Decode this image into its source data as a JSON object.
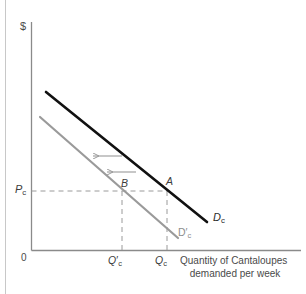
{
  "figure": {
    "axis": {
      "y_label": "$",
      "origin_label": "0",
      "x_caption_line1": "Quantity of Cantaloupes",
      "x_caption_line2": "demanded per week"
    },
    "tick_labels": {
      "price": {
        "base": "P",
        "sub": "c"
      },
      "quantity_new": {
        "base": "Q",
        "prime": "′",
        "sub": "c"
      },
      "quantity_original": {
        "base": "Q",
        "sub": "c"
      }
    },
    "points": [
      {
        "name": "point-a",
        "label": "A",
        "x": 167,
        "y": 191
      },
      {
        "name": "point-b",
        "label": "B",
        "x": 122,
        "y": 191
      }
    ],
    "curves": [
      {
        "name": "demand-curve-original",
        "label_base": "D",
        "label_sub": "c",
        "label_prime": "",
        "color": "#111111",
        "width": 2.6,
        "x1": 46,
        "y1": 92,
        "x2": 207,
        "y2": 222
      },
      {
        "name": "demand-curve-shifted",
        "label_base": "D",
        "label_sub": "c",
        "label_prime": "′",
        "color": "#9a9a9a",
        "width": 2.2,
        "x1": 40,
        "y1": 117,
        "x2": 178,
        "y2": 238
      }
    ],
    "arrows": [
      {
        "name": "shift-arrow-upper",
        "x_from": 122,
        "x_to": 92,
        "y": 156
      },
      {
        "name": "shift-arrow-lower",
        "x_from": 136,
        "x_to": 106,
        "y": 172
      }
    ],
    "guides": {
      "price_line_y": 191,
      "price_line_x_from": 31,
      "price_line_x_to": 168,
      "q_new_x": 122,
      "q_orig_x": 167,
      "guide_y_bottom": 250
    },
    "colors": {
      "axis": "#8a8a8a",
      "dashed": "#9a9a9a",
      "curve_primary": "#111111",
      "curve_secondary": "#9a9a9a",
      "arrow": "#9a9a9a",
      "text": "#3c3c3c",
      "frame": "#c8c8c8"
    }
  }
}
